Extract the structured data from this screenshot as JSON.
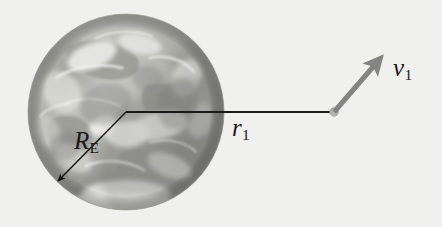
{
  "figure": {
    "kind": "physics-diagram",
    "background_color": "#f3f3f2"
  },
  "earth": {
    "name": "earth-globe",
    "center_x": 126,
    "center_y": 112,
    "radius": 98,
    "fill_color": "#a8a8a4",
    "highlight_color": "#d9d9d4",
    "shadow_color": "#8d8d8a"
  },
  "labels": {
    "earth_radius": {
      "symbol": "R",
      "subscript": "E",
      "text": "RE"
    },
    "orbital_radius": {
      "symbol": "r",
      "subscript": "1",
      "text": "r1"
    },
    "velocity": {
      "symbol": "v",
      "subscript": "1",
      "text": "v1"
    }
  },
  "vectors": {
    "radius_line": {
      "name": "orbital-radius-line",
      "x1": 126,
      "y1": 112,
      "x2": 334,
      "y2": 112,
      "color": "#1a1a1a",
      "width": 1.8
    },
    "earth_radius_arrow": {
      "name": "earth-radius-arrow",
      "x1": 126,
      "y1": 112,
      "x2": 57,
      "y2": 182,
      "color": "#111111",
      "width": 1.4
    },
    "velocity_arrow": {
      "name": "velocity-vector",
      "x1": 334,
      "y1": 112,
      "x2": 382,
      "y2": 56,
      "color": "#848484",
      "width": 5
    }
  },
  "satellite": {
    "name": "satellite-marker",
    "cx": 334,
    "cy": 112,
    "r": 4,
    "color": "#b3b3b0"
  }
}
